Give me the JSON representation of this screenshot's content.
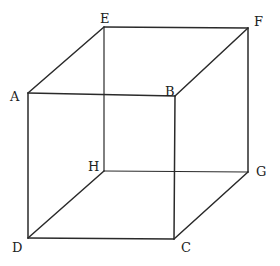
{
  "diagram": {
    "type": "cube-wireframe",
    "vertices": {
      "A": {
        "label": "A",
        "x": 28,
        "y": 93,
        "lx": 10,
        "ly": 101
      },
      "B": {
        "label": "B",
        "x": 175,
        "y": 96,
        "lx": 165,
        "ly": 96
      },
      "C": {
        "label": "C",
        "x": 174,
        "y": 239,
        "lx": 181,
        "ly": 252
      },
      "D": {
        "label": "D",
        "x": 28,
        "y": 238,
        "lx": 12,
        "ly": 252
      },
      "E": {
        "label": "E",
        "x": 104,
        "y": 27,
        "lx": 100,
        "ly": 23
      },
      "F": {
        "label": "F",
        "x": 248,
        "y": 28,
        "lx": 254,
        "ly": 26
      },
      "G": {
        "label": "G",
        "x": 248,
        "y": 172,
        "lx": 256,
        "ly": 176
      },
      "H": {
        "label": "H",
        "x": 104,
        "y": 171,
        "lx": 88,
        "ly": 171
      }
    },
    "edges": [
      [
        "A",
        "B"
      ],
      [
        "B",
        "C"
      ],
      [
        "C",
        "D"
      ],
      [
        "D",
        "A"
      ],
      [
        "E",
        "F"
      ],
      [
        "F",
        "G"
      ],
      [
        "G",
        "H"
      ],
      [
        "H",
        "E"
      ],
      [
        "A",
        "E"
      ],
      [
        "B",
        "F"
      ],
      [
        "C",
        "G"
      ],
      [
        "D",
        "H"
      ]
    ],
    "line_color": "#2a2a2a"
  }
}
